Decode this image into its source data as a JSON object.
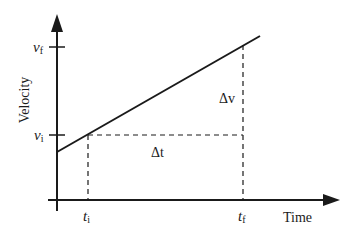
{
  "diagram": {
    "y_axis_label": "Velocity",
    "x_axis_label": "Time",
    "y_ticks": [
      {
        "label": "v",
        "sub": "f"
      },
      {
        "label": "v",
        "sub": "i"
      }
    ],
    "x_ticks": [
      {
        "label": "t",
        "sub": "i"
      },
      {
        "label": "t",
        "sub": "f"
      }
    ],
    "annotations": {
      "delta_v": "Δv",
      "delta_t": "Δt"
    },
    "colors": {
      "line": "#1a1a1a",
      "background": "#ffffff"
    }
  }
}
